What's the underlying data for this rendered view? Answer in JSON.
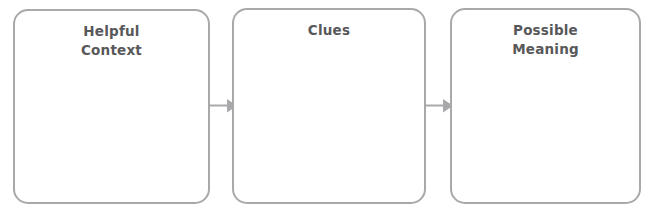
{
  "diagram": {
    "type": "flow-diagram",
    "orientation": "horizontal",
    "background_color": "#ffffff",
    "box_border_color": "#a9a9ab",
    "box_fill_color": "#ffffff",
    "text_color": "#58585a",
    "arrow_color": "#a9a9ab",
    "boxes": [
      {
        "id": "helpful-context",
        "label": "Helpful\nContext"
      },
      {
        "id": "clues",
        "label": "Clues"
      },
      {
        "id": "possible-meaning",
        "label": "Possible\nMeaning"
      }
    ],
    "arrows": [
      {
        "id": "arrow-1",
        "from": "helpful-context",
        "to": "clues",
        "direction": "right"
      },
      {
        "id": "arrow-2",
        "from": "clues",
        "to": "possible-meaning",
        "direction": "right"
      }
    ]
  }
}
